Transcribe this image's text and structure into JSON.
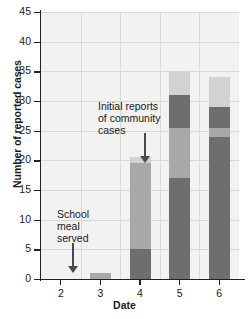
{
  "chart_data": {
    "type": "bar",
    "title": "",
    "xlabel": "Date",
    "ylabel": "Number of reported cases",
    "categories": [
      "2",
      "3",
      "4",
      "5",
      "6"
    ],
    "ylim": [
      0,
      45
    ],
    "ytick_values": [
      0,
      5,
      10,
      15,
      20,
      25,
      30,
      35,
      40,
      45
    ],
    "ytick_labels": [
      "0",
      "5",
      "10",
      "15",
      "20",
      "25",
      "30",
      "35",
      "40",
      "45"
    ],
    "grid": true,
    "legend": "none",
    "stacked": true,
    "series": [
      {
        "name": "segment-1",
        "color": "#6e6e6e",
        "values": [
          0,
          0,
          5,
          17,
          24
        ]
      },
      {
        "name": "segment-2",
        "color": "#a8a8a8",
        "values": [
          0,
          1,
          14.5,
          8.5,
          1.5
        ]
      },
      {
        "name": "segment-3",
        "color": "#6e6e6e",
        "values": [
          0,
          0,
          0,
          5.5,
          3.5
        ]
      },
      {
        "name": "segment-4",
        "color": "#d2d2d2",
        "values": [
          0,
          0,
          1,
          4,
          5
        ]
      }
    ],
    "totals": [
      0,
      1,
      20.5,
      35,
      34
    ],
    "annotations": [
      {
        "id": "school-meal",
        "text": "School\nmeal\nserved",
        "target_category": "2",
        "arrow": "down"
      },
      {
        "id": "initial-reports",
        "text": "Initial reports\nof community\ncases",
        "target_category": "4",
        "arrow": "down"
      }
    ]
  },
  "colors": {
    "plot_background": "#f2f2f0",
    "gridline": "#d8d8d6",
    "axis": "#222222",
    "arrow": "#4a4a4a",
    "text": "#1a1a1a"
  }
}
